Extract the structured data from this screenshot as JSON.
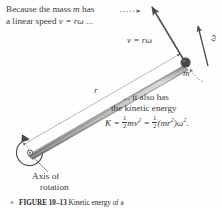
{
  "figure": {
    "title_label": "FIGURE 10–13",
    "caption_text": "Kinetic energy of a",
    "background_color": "#fefefe",
    "ink_color": "#3a3a3a",
    "rod_fill_color": "#b9b9b9",
    "rod_edge_color": "#6e6e6e",
    "mass_color": "#4a4a4a"
  },
  "annotations": {
    "top_note_line1_pre": "Because the mass ",
    "top_note_line1_var": "m",
    "top_note_line1_post": " has",
    "top_note_dots": "·······",
    "top_note_line2_pre": "a linear speed ",
    "top_note_line2_eq": "v = rω",
    "top_note_line2_post": " ...",
    "velocity_label": "v = rω",
    "omega_label": "ω",
    "mass_label": "m",
    "radius_label": "r",
    "axis_label_line1": "Axis of",
    "axis_label_line2": "rotation",
    "ke_note_line1": "... it also has",
    "ke_note_line2": "the kinetic energy",
    "ke_equation": {
      "lhs": "K",
      "eq1": "=",
      "half1_num": "1",
      "half1_den": "2",
      "term1_m": "m",
      "term1_v": "v",
      "term1_exp": "2",
      "eq2": "=",
      "half2_num": "1",
      "half2_den": "2",
      "term2_open": "(",
      "term2_m": "m",
      "term2_r": "r",
      "term2_rexp": "2",
      "term2_close": ")",
      "term2_w": "ω",
      "term2_wexp": "2",
      "period": "."
    }
  },
  "geometry": {
    "pivot_x": 30,
    "pivot_y": 152,
    "mass_x": 186,
    "mass_y": 63,
    "velocity_arrow_tip_x": 150,
    "velocity_arrow_tip_y": 4,
    "omega_arrow_tip_x": 200,
    "omega_arrow_tip_y": 26
  }
}
